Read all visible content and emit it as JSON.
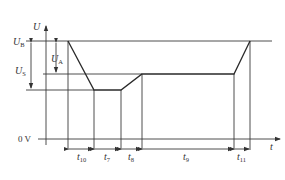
{
  "diagram": {
    "type": "voltage-time waveform",
    "y_axis_label": {
      "main": "U",
      "sub": ""
    },
    "x_axis_label": {
      "main": "t",
      "sub": ""
    },
    "levels": [
      {
        "id": "UB",
        "main": "U",
        "sub": "B"
      },
      {
        "id": "US",
        "main": "U",
        "sub": "S"
      },
      {
        "id": "UA",
        "main": "U",
        "sub": "A"
      }
    ],
    "zero_label": "0 V",
    "intervals": [
      {
        "id": "t10",
        "main": "t",
        "sub": "10"
      },
      {
        "id": "t7",
        "main": "t",
        "sub": "7"
      },
      {
        "id": "t8",
        "main": "t",
        "sub": "8"
      },
      {
        "id": "t9",
        "main": "t",
        "sub": "9"
      },
      {
        "id": "t11",
        "main": "t",
        "sub": "11"
      }
    ],
    "waveform_description": "Voltage starts at U_B, falls during t10 to minimum, holds during t7, rises during t8 to U_S, holds during t9, rises back to U_B during t11"
  }
}
